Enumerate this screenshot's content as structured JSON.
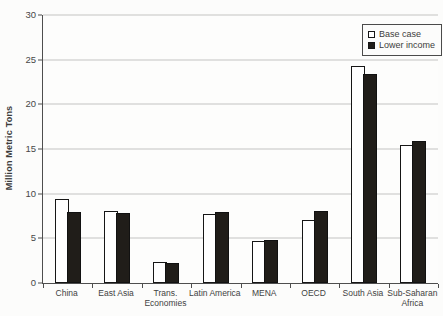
{
  "chart_data": {
    "type": "bar",
    "title": "",
    "ylabel": "Million Metric Tons",
    "xlabel": "",
    "ylim": [
      0,
      30
    ],
    "y_ticks": [
      0,
      5,
      10,
      15,
      20,
      25,
      30
    ],
    "grid": "horizontal",
    "legend_position": "top-right",
    "categories": [
      "China",
      "East Asia",
      "Trans. Economies",
      "Latin America",
      "MENA",
      "OECD",
      "South Asia",
      "Sub-Saharan Africa"
    ],
    "series": [
      {
        "name": "Base case",
        "color": "#ffffff",
        "values": [
          9.4,
          8.1,
          2.4,
          7.7,
          4.7,
          7.1,
          24.3,
          15.5
        ]
      },
      {
        "name": "Lower income",
        "color": "#201d19",
        "values": [
          8.0,
          7.8,
          2.2,
          7.9,
          4.8,
          8.1,
          23.4,
          15.9
        ]
      }
    ],
    "colors": {
      "axis": "#4e4e4e",
      "gridline": "#c3c3c1",
      "background": "#fcfcfb"
    }
  }
}
